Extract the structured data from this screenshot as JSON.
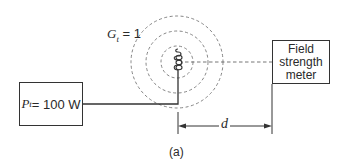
{
  "diagram": {
    "caption": "(a)",
    "gain_label": {
      "symbol": "G",
      "subscript": "t",
      "rest": " = 1"
    },
    "transmitter": {
      "symbol": "P",
      "subscript": "t",
      "rest": " = 100 W"
    },
    "meter": {
      "lines": [
        "Field",
        "strength",
        "meter"
      ]
    },
    "distance_label": "d",
    "antenna": "helical coil antenna",
    "wavefronts": {
      "count": 3,
      "style": "dashed",
      "radii_px": [
        16,
        31,
        46
      ]
    },
    "colors": {
      "line": "#333333",
      "dashed": "#666666",
      "text": "#2a2a2a"
    }
  }
}
